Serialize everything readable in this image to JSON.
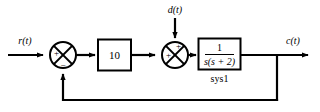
{
  "diagram": {
    "type": "control-system-block-diagram",
    "signals": {
      "reference": "r(t)",
      "disturbance": "d(t)",
      "output": "c(t)"
    },
    "blocks": [
      {
        "id": "gain",
        "label": "10",
        "kind": "gain"
      },
      {
        "id": "plant",
        "numerator": "1",
        "denominator": "s(s + 2)",
        "name": "sys1",
        "kind": "transfer-function"
      }
    ],
    "summing_junctions": [
      {
        "id": "error-sum",
        "inputs": [
          {
            "port": "left",
            "sign": "+"
          },
          {
            "port": "bottom",
            "sign": "−"
          }
        ]
      },
      {
        "id": "disturbance-sum",
        "inputs": [
          {
            "port": "left",
            "sign": "+"
          },
          {
            "port": "top",
            "sign": "+"
          }
        ]
      }
    ],
    "feedback": {
      "path": "unity",
      "description": "output fed back to error summing junction"
    },
    "colors": {
      "line": "#000000",
      "fill": "#ffffff",
      "text": "#000000"
    }
  }
}
